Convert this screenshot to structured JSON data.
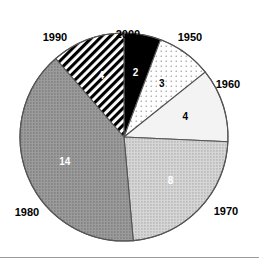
{
  "chart_data": {
    "type": "pie",
    "title": "",
    "subtitle": "",
    "xlabel": "",
    "ylabel": "",
    "legend_position": "outside-slice-labels",
    "grid": false,
    "total": 35,
    "start_angle_deg": 0,
    "direction": "clockwise",
    "categories": [
      "2000",
      "1950",
      "1960",
      "1970",
      "1980",
      "1990"
    ],
    "values": [
      2,
      3,
      4,
      8,
      14,
      4
    ],
    "slices": [
      {
        "category": "2000",
        "value": 2,
        "value_text": "2",
        "percent": 5.7,
        "start_deg": 0,
        "end_deg": 20.6,
        "fill": "#000000",
        "pattern": "solid",
        "value_text_color": "#ffffff",
        "label_x": 128,
        "label_y": 35
      },
      {
        "category": "1950",
        "value": 3,
        "value_text": "3",
        "percent": 8.6,
        "start_deg": 20.6,
        "end_deg": 51.4,
        "fill": "#fdfdfd",
        "pattern": "dots-sparse",
        "value_text_color": "#000000",
        "label_x": 190,
        "label_y": 38
      },
      {
        "category": "1960",
        "value": 4,
        "value_text": "4",
        "percent": 11.4,
        "start_deg": 51.4,
        "end_deg": 92.6,
        "fill": "#f3f3f3",
        "pattern": "solid",
        "value_text_color": "#000000",
        "label_x": 228,
        "label_y": 85
      },
      {
        "category": "1970",
        "value": 8,
        "value_text": "8",
        "percent": 22.9,
        "start_deg": 92.6,
        "end_deg": 174.9,
        "fill": "#c8c8c8",
        "pattern": "dots-dense",
        "value_text_color": "#ffffff",
        "label_x": 226,
        "label_y": 212
      },
      {
        "category": "1980",
        "value": 14,
        "value_text": "14",
        "percent": 40.0,
        "start_deg": 174.9,
        "end_deg": 319.0,
        "fill": "#8f8f8f",
        "pattern": "dots-dense",
        "value_text_color": "#ffffff",
        "label_x": 27,
        "label_y": 213
      },
      {
        "category": "1990",
        "value": 4,
        "value_text": "4",
        "percent": 11.4,
        "start_deg": 319.0,
        "end_deg": 360.0,
        "fill": "#ffffff",
        "pattern": "diagonal-hatch",
        "value_text_color": "#ffffff",
        "label_x": 55,
        "label_y": 38
      }
    ],
    "geometry": {
      "center_x": 124,
      "center_y": 137,
      "radius": 104,
      "outline_color": "#555555"
    }
  }
}
